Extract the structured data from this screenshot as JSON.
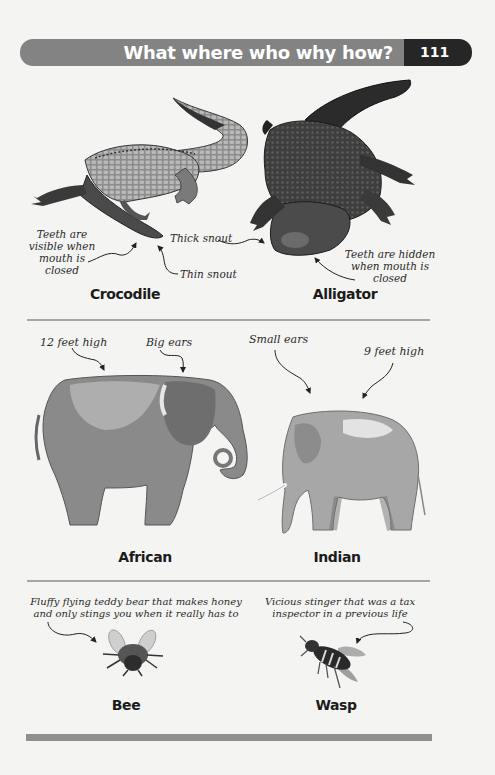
{
  "header": {
    "title": "What where who why how?",
    "page_number": "111",
    "bar_color": "#838383",
    "page_box_color": "#262626"
  },
  "sections": [
    {
      "id": "reptiles",
      "items": [
        {
          "name": "Crocodile",
          "image": "crocodile-illustration",
          "annotations": [
            "Teeth are visible when mouth is closed",
            "Thin snout"
          ],
          "annotation_lines": [
            "Teeth are",
            "visible when",
            "mouth is",
            "closed"
          ]
        },
        {
          "name": "Alligator",
          "image": "alligator-illustration",
          "annotations": [
            "Thick snout",
            "Teeth are hidden when mouth is closed"
          ],
          "annotation_lines": [
            "Teeth are hidden",
            "when mouth is",
            "closed"
          ]
        }
      ]
    },
    {
      "id": "elephants",
      "items": [
        {
          "name": "African",
          "image": "african-elephant-illustration",
          "annotations": [
            "12 feet high",
            "Big ears"
          ]
        },
        {
          "name": "Indian",
          "image": "indian-elephant-illustration",
          "annotations": [
            "Small ears",
            "9 feet high"
          ]
        }
      ]
    },
    {
      "id": "insects",
      "items": [
        {
          "name": "Bee",
          "image": "bee-illustration",
          "annotation_lines": [
            "Fluffy flying teddy bear that makes honey",
            "and only stings you when it really has to"
          ]
        },
        {
          "name": "Wasp",
          "image": "wasp-illustration",
          "annotation_lines": [
            "Vicious stinger that was a tax",
            "inspector in a previous life"
          ]
        }
      ]
    }
  ]
}
